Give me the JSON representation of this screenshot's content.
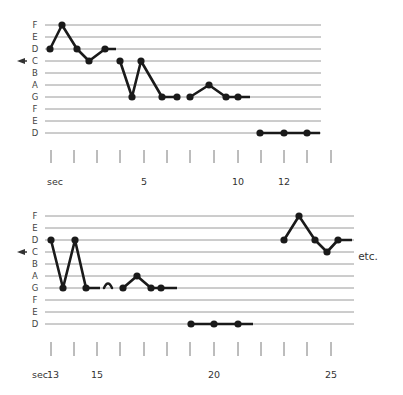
{
  "pitch_labels": [
    "F",
    "E",
    "D",
    "C",
    "B",
    "A",
    "G",
    "F",
    "E",
    "D"
  ],
  "marker_pitch": "C",
  "colors": {
    "staff": "#9a9a9a",
    "contour": "#1a1a1a",
    "tick": "#7a7a7a",
    "text": "#444444"
  },
  "systems": [
    {
      "name": "system-1",
      "staff": {
        "x0": 45,
        "x1": 321,
        "y0": 25,
        "spacing": 12
      },
      "groups": [
        {
          "points": [
            [
              50,
              "D"
            ],
            [
              62,
              "F"
            ],
            [
              77,
              "D"
            ],
            [
              89,
              "C"
            ],
            [
              105,
              "D"
            ]
          ],
          "tail_to": 116
        },
        {
          "points": [
            [
              120,
              "C"
            ],
            [
              132,
              "G"
            ],
            [
              141,
              "C"
            ],
            [
              162,
              "G"
            ],
            [
              177,
              "G"
            ]
          ]
        },
        {
          "points": [
            [
              190,
              "G"
            ],
            [
              209,
              "A"
            ],
            [
              226,
              "G"
            ],
            [
              238,
              "G"
            ]
          ],
          "tail_to": 250
        },
        {
          "points": [
            [
              260,
              "D2"
            ],
            [
              284,
              "D2"
            ],
            [
              307,
              "D2"
            ]
          ],
          "tail_to": 320
        }
      ],
      "ticks": {
        "x": [
          51,
          74,
          97,
          120,
          144,
          167,
          190,
          214,
          238,
          261,
          284,
          307,
          331
        ],
        "y0": 150,
        "y1": 163
      },
      "tick_labels": [
        {
          "x": 55,
          "text": "sec"
        },
        {
          "x": 144,
          "text": "5"
        },
        {
          "x": 238,
          "text": "10"
        },
        {
          "x": 284,
          "text": "12"
        }
      ],
      "tick_label_y": 185
    },
    {
      "name": "system-2",
      "staff": {
        "x0": 45,
        "x1": 354,
        "y0": 216,
        "spacing": 12
      },
      "groups": [
        {
          "points": [
            [
              51,
              "D"
            ],
            [
              63,
              "G"
            ],
            [
              75,
              "D"
            ],
            [
              86,
              "G"
            ]
          ],
          "tail_to": 100
        },
        {
          "arc": [
            104,
            112,
            "G"
          ]
        },
        {
          "points": [
            [
              123,
              "G"
            ],
            [
              137,
              "A"
            ],
            [
              151,
              "G"
            ],
            [
              161,
              "G"
            ]
          ],
          "tail_to": 177
        },
        {
          "points": [
            [
              191,
              "D2"
            ],
            [
              214,
              "D2"
            ],
            [
              238,
              "D2"
            ]
          ],
          "tail_to": 253
        },
        {
          "points": [
            [
              284,
              "D"
            ],
            [
              299,
              "F"
            ],
            [
              315,
              "D"
            ],
            [
              327,
              "C"
            ],
            [
              338,
              "D"
            ]
          ],
          "tail_to": 352
        }
      ],
      "ticks": {
        "x": [
          51,
          74,
          97,
          120,
          144,
          167,
          190,
          214,
          238,
          261,
          284,
          307,
          331
        ],
        "y0": 342,
        "y1": 356
      },
      "tick_labels": [
        {
          "x": 40,
          "text": "sec"
        },
        {
          "x": 53,
          "text": "13"
        },
        {
          "x": 97,
          "text": "15"
        },
        {
          "x": 214,
          "text": "20"
        },
        {
          "x": 331,
          "text": "25"
        }
      ],
      "tick_label_y": 378,
      "suffix": {
        "x": 368,
        "y": 260,
        "text": "etc."
      }
    }
  ]
}
